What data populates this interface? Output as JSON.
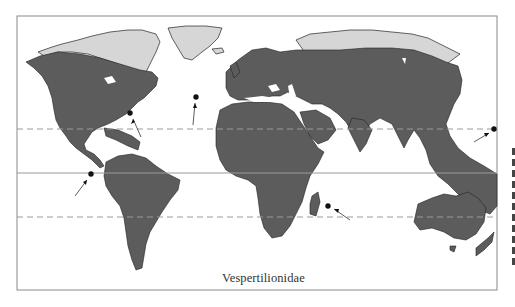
{
  "figure": {
    "caption": "Vespertilionidae",
    "type": "world distribution map"
  },
  "map": {
    "colors": {
      "range_fill": "#5c5c5c",
      "nonrange_land": "#d6d6d6",
      "ocean": "#ffffff",
      "frame": "#8a8a8a",
      "coastline": "#222222",
      "reference_lines": "#9a9a9a",
      "markers": "#111111"
    },
    "reference_lines": [
      {
        "name": "Tropic of Cancer",
        "style": "dashed",
        "y": 129
      },
      {
        "name": "Equator",
        "style": "solid",
        "y": 173
      },
      {
        "name": "Tropic of Capricorn",
        "style": "dashed",
        "y": 217
      }
    ],
    "island_markers": [
      {
        "label": "Bermuda",
        "x": 130,
        "y": 113
      },
      {
        "label": "Azores",
        "x": 196,
        "y": 97
      },
      {
        "label": "Galapagos",
        "x": 91,
        "y": 174
      },
      {
        "label": "Mauritius/Reunion",
        "x": 328,
        "y": 206
      },
      {
        "label": "Pacific island",
        "x": 494,
        "y": 129
      }
    ]
  }
}
